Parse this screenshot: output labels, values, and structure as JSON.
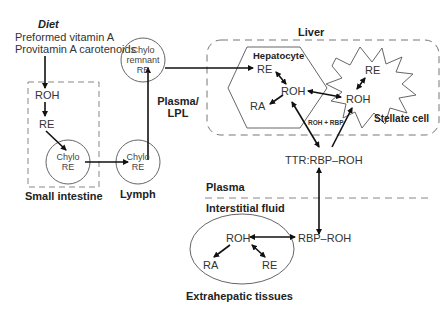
{
  "diagram": {
    "diet": {
      "title": "Diet",
      "line1": "Preformed vitamin A",
      "line2": "Provitamin A carotenoids"
    },
    "small_intestine": {
      "label": "Small intestine",
      "roh": "ROH",
      "re": "RE",
      "chylo_line1": "Chylo",
      "chylo_line2": "RE"
    },
    "lymph": {
      "label": "Lymph",
      "chylo_line1": "Chylo",
      "chylo_line2": "RE"
    },
    "plasma_lpl": {
      "line1": "Plasma/",
      "line2": "LPL"
    },
    "chylo_remnant": {
      "line1": "Chylo",
      "line2": "remnant",
      "line3": "RE"
    },
    "liver": {
      "label": "Liver",
      "hepatocyte": {
        "label": "Hepatocyte",
        "re": "RE",
        "roh": "ROH",
        "ra": "RA"
      },
      "stellate": {
        "label": "Stellate cell",
        "re": "RE",
        "roh": "ROH"
      },
      "transfer_label": "ROH + RBP"
    },
    "ttr_complex": "TTR:RBP–ROH",
    "compartments": {
      "plasma": "Plasma",
      "interstitial": "Interstitial fluid"
    },
    "extrahepatic": {
      "label": "Extrahepatic tissues",
      "roh": "ROH",
      "ra": "RA",
      "re": "RE",
      "rbp_roh": "RBP–ROH"
    }
  }
}
